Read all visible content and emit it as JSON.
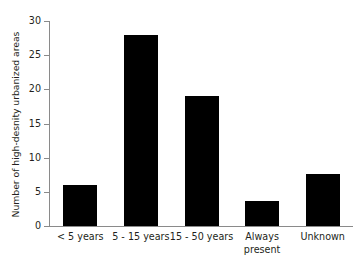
{
  "chart_data": {
    "type": "bar",
    "title": "",
    "xlabel": "",
    "ylabel": "Number of high-desnity urbanized areas",
    "categories": [
      "< 5 years",
      "5 - 15 years",
      "15 - 50 years",
      "Always present",
      "Unknown"
    ],
    "category_lines": [
      [
        "< 5 years"
      ],
      [
        "5 - 15 years"
      ],
      [
        "15 - 50 years"
      ],
      [
        "Always",
        "present"
      ],
      [
        "Unknown"
      ]
    ],
    "values": [
      6,
      28,
      19,
      3.7,
      7.6
    ],
    "ylim": [
      0,
      30
    ],
    "yticks": [
      0,
      5,
      10,
      15,
      20,
      25,
      30
    ],
    "ytick_labels": [
      "0",
      "5",
      "10",
      "15",
      "20",
      "25",
      "30"
    ],
    "grid": false,
    "legend": false,
    "bar_color": "#000000",
    "axis_color": "#8a8a8a",
    "text_color": "#231f20",
    "background_color": "#ffffff"
  }
}
